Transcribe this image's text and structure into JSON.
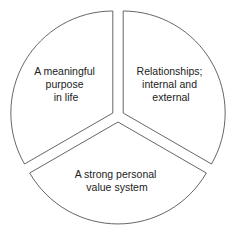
{
  "diagram": {
    "type": "exploded-pie",
    "stroke_color": "#555555",
    "fill_color": "#ffffff",
    "segments": [
      {
        "id": "purpose",
        "lines": [
          "A meaningful",
          "purpose",
          "in life"
        ]
      },
      {
        "id": "relationships",
        "lines": [
          "Relationships;",
          "internal and",
          "external"
        ]
      },
      {
        "id": "values",
        "lines": [
          "A strong personal",
          "value system"
        ]
      }
    ]
  }
}
